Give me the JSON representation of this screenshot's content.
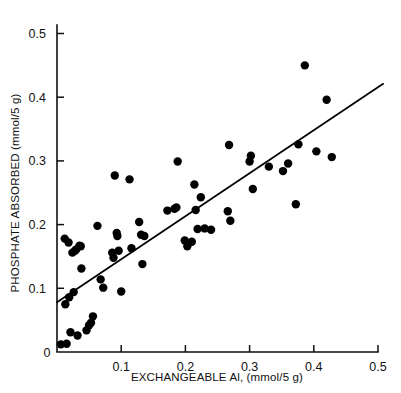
{
  "chart_data": {
    "type": "scatter",
    "title": "",
    "xlabel": "EXCHANGEABLE Al, (mmol/5 g)",
    "ylabel": "PHOSPHATE ABSORBED (mmol/5 g)",
    "xlim": [
      0,
      0.5
    ],
    "ylim": [
      0,
      0.55
    ],
    "grid": false,
    "legend": null,
    "xticks": [
      0,
      0.1,
      0.2,
      0.3,
      0.4,
      0.5
    ],
    "xtick_labels": [
      "0",
      "0.1",
      "0.2",
      "0.3",
      "0.4",
      "0.5"
    ],
    "yticks": [
      0,
      0.1,
      0.2,
      0.3,
      0.4,
      0.5
    ],
    "ytick_labels": [
      "0",
      "0.1",
      "0.2",
      "0.3",
      "0.4",
      "0.5"
    ],
    "marker": "filled-circle",
    "marker_color": "#000000",
    "marker_size_px": 4.2,
    "points": [
      [
        0.006,
        0.012
      ],
      [
        0.012,
        0.178
      ],
      [
        0.013,
        0.075
      ],
      [
        0.015,
        0.013
      ],
      [
        0.018,
        0.172
      ],
      [
        0.019,
        0.086
      ],
      [
        0.021,
        0.031
      ],
      [
        0.024,
        0.156
      ],
      [
        0.026,
        0.094
      ],
      [
        0.028,
        0.159
      ],
      [
        0.03,
        0.161
      ],
      [
        0.032,
        0.026
      ],
      [
        0.035,
        0.167
      ],
      [
        0.037,
        0.166
      ],
      [
        0.038,
        0.131
      ],
      [
        0.046,
        0.034
      ],
      [
        0.05,
        0.042
      ],
      [
        0.053,
        0.046
      ],
      [
        0.056,
        0.056
      ],
      [
        0.063,
        0.198
      ],
      [
        0.068,
        0.114
      ],
      [
        0.072,
        0.101
      ],
      [
        0.086,
        0.156
      ],
      [
        0.088,
        0.148
      ],
      [
        0.09,
        0.277
      ],
      [
        0.093,
        0.187
      ],
      [
        0.094,
        0.182
      ],
      [
        0.096,
        0.159
      ],
      [
        0.1,
        0.095
      ],
      [
        0.113,
        0.271
      ],
      [
        0.116,
        0.163
      ],
      [
        0.128,
        0.204
      ],
      [
        0.131,
        0.184
      ],
      [
        0.133,
        0.138
      ],
      [
        0.136,
        0.182
      ],
      [
        0.172,
        0.222
      ],
      [
        0.183,
        0.225
      ],
      [
        0.186,
        0.227
      ],
      [
        0.188,
        0.299
      ],
      [
        0.199,
        0.175
      ],
      [
        0.203,
        0.166
      ],
      [
        0.21,
        0.173
      ],
      [
        0.214,
        0.263
      ],
      [
        0.216,
        0.223
      ],
      [
        0.219,
        0.193
      ],
      [
        0.224,
        0.243
      ],
      [
        0.23,
        0.194
      ],
      [
        0.24,
        0.192
      ],
      [
        0.266,
        0.221
      ],
      [
        0.268,
        0.325
      ],
      [
        0.27,
        0.206
      ],
      [
        0.3,
        0.299
      ],
      [
        0.302,
        0.308
      ],
      [
        0.305,
        0.256
      ],
      [
        0.33,
        0.291
      ],
      [
        0.352,
        0.284
      ],
      [
        0.36,
        0.296
      ],
      [
        0.372,
        0.232
      ],
      [
        0.376,
        0.326
      ],
      [
        0.386,
        0.45
      ],
      [
        0.404,
        0.315
      ],
      [
        0.42,
        0.396
      ],
      [
        0.428,
        0.306
      ]
    ],
    "fit_line": {
      "type": "linear-regression",
      "x_start": 0.0,
      "y_start": 0.078,
      "x_end": 0.508,
      "y_end": 0.421
    }
  }
}
